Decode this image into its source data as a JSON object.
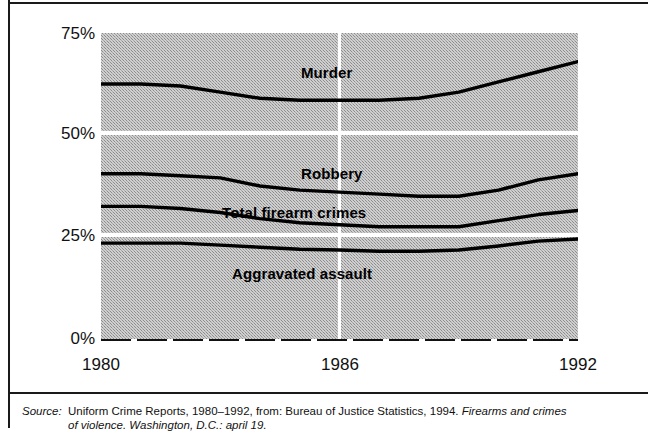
{
  "chart_data": {
    "type": "line",
    "title": "",
    "subtitle": "",
    "xlabel": "",
    "ylabel": "",
    "x": [
      1980,
      1981,
      1982,
      1983,
      1984,
      1985,
      1986,
      1987,
      1988,
      1989,
      1990,
      1991,
      1992
    ],
    "xlim": [
      1980,
      1992
    ],
    "ylim": [
      0,
      75
    ],
    "y_ticks": [
      "0%",
      "25%",
      "50%",
      "75%"
    ],
    "y_tick_values": [
      0,
      25,
      50,
      75
    ],
    "x_ticks": [
      "1980",
      "1986",
      "1992"
    ],
    "x_tick_values": [
      1980,
      1986,
      1992
    ],
    "grid": "horizontal white gridlines at 25% and 50%; vertical white gridline at 1986",
    "legend": "inline labels on plot",
    "plot_background": "#b8b8b8 halftone dot screen",
    "line_color": "#000000",
    "series": [
      {
        "name": "Murder",
        "label_x": 1985.0,
        "label_y": 65.5,
        "values": [
          62.5,
          62.5,
          62.0,
          60.5,
          59.0,
          58.5,
          58.5,
          58.5,
          59.0,
          60.5,
          63.0,
          65.5,
          68.0
        ]
      },
      {
        "name": "Robbery",
        "label_x": 1985.0,
        "label_y": 43.0,
        "values": [
          40.5,
          40.5,
          40.0,
          39.5,
          37.5,
          36.5,
          36.0,
          35.5,
          35.0,
          35.0,
          36.5,
          39.0,
          40.5
        ]
      },
      {
        "name": "Total firearm crimes",
        "label_x": 1984.7,
        "label_y": 33.5,
        "values": [
          32.5,
          32.5,
          32.0,
          31.0,
          29.5,
          28.5,
          28.0,
          27.5,
          27.5,
          27.5,
          29.0,
          30.5,
          31.5
        ]
      },
      {
        "name": "Aggravated assault",
        "label_x": 1984.9,
        "label_y": 19.0,
        "values": [
          23.5,
          23.5,
          23.5,
          23.0,
          22.5,
          22.0,
          21.8,
          21.5,
          21.5,
          21.8,
          22.8,
          24.0,
          24.5
        ]
      }
    ]
  },
  "caption": {
    "source_label": "Source:",
    "line1": "Uniform Crime Reports, 1980–1992, from: Bureau of Justice Statistics, 1994.",
    "line1_italic": "Firearms and crimes",
    "line2": "of violence. Washington, D.C.: april 19."
  }
}
